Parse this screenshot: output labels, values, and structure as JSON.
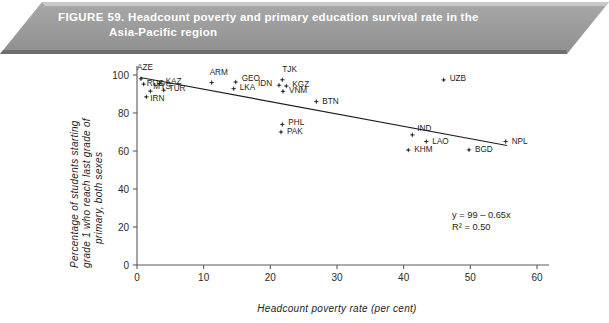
{
  "banner": {
    "figure_number": "FIGURE 59.",
    "title_line1": "Headcount poverty and primary education survival rate in the",
    "title_line2": "Asia-Pacific region",
    "bg_color": "#9d9d9d",
    "text_color": "#ffffff"
  },
  "chart_data": {
    "type": "scatter",
    "title": "Headcount poverty and primary education survival rate in the Asia-Pacific region",
    "xlabel": "Headcount poverty rate (per cent)",
    "ylabel": "Percentage of students starting grade 1 who reach last grade of primary, both sexes",
    "ylabel_line1": "Percentage of students starting",
    "ylabel_line2": "grade 1 who reach last grade of",
    "ylabel_line3": "primary, both sexes",
    "xlim": [
      0,
      60
    ],
    "ylim": [
      0,
      100
    ],
    "xticks": [
      0,
      10,
      20,
      30,
      40,
      50,
      60
    ],
    "yticks": [
      0,
      20,
      40,
      60,
      80,
      100
    ],
    "grid": false,
    "legend": "none",
    "marker": "plus-dot",
    "points": [
      {
        "label": "AZE",
        "x": 0.6,
        "y": 98.0,
        "lx": -4,
        "ly": -9
      },
      {
        "label": "RUS",
        "x": 1.0,
        "y": 95.2,
        "lx": 3,
        "ly": 2
      },
      {
        "label": "KAZ",
        "x": 3.4,
        "y": 95.6,
        "lx": 6,
        "ly": 1
      },
      {
        "label": "TUR",
        "x": 4.0,
        "y": 92.0,
        "lx": 5,
        "ly": 1
      },
      {
        "label": "MYS",
        "x": 2.0,
        "y": 91.5,
        "lx": 3,
        "ly": -2
      },
      {
        "label": "IRN",
        "x": 1.4,
        "y": 88.5,
        "lx": 4,
        "ly": 4
      },
      {
        "label": "ARM",
        "x": 11.2,
        "y": 96.0,
        "lx": -2,
        "ly": -8
      },
      {
        "label": "GEO",
        "x": 14.8,
        "y": 96.3,
        "lx": 6,
        "ly": -1
      },
      {
        "label": "LKA",
        "x": 14.5,
        "y": 92.8,
        "lx": 6,
        "ly": 1
      },
      {
        "label": "TJK",
        "x": 21.8,
        "y": 97.5,
        "lx": 0,
        "ly": -8
      },
      {
        "label": "IDN",
        "x": 21.3,
        "y": 94.6,
        "lx": -21,
        "ly": 1
      },
      {
        "label": "KGZ",
        "x": 22.4,
        "y": 94.2,
        "lx": 6,
        "ly": 1
      },
      {
        "label": "VNM",
        "x": 21.9,
        "y": 91.4,
        "lx": 6,
        "ly": 2
      },
      {
        "label": "BTN",
        "x": 26.9,
        "y": 86.0,
        "lx": 6,
        "ly": 2
      },
      {
        "label": "PHL",
        "x": 21.8,
        "y": 74.0,
        "lx": 6,
        "ly": 1
      },
      {
        "label": "PAK",
        "x": 21.6,
        "y": 70.0,
        "lx": 6,
        "ly": 2
      },
      {
        "label": "UZB",
        "x": 46.0,
        "y": 97.4,
        "lx": 6,
        "ly": 1
      },
      {
        "label": "IND",
        "x": 41.3,
        "y": 68.5,
        "lx": 5,
        "ly": -4
      },
      {
        "label": "LAO",
        "x": 43.4,
        "y": 65.0,
        "lx": 6,
        "ly": 2
      },
      {
        "label": "KHM",
        "x": 40.7,
        "y": 60.5,
        "lx": 6,
        "ly": 2
      },
      {
        "label": "BGD",
        "x": 49.8,
        "y": 60.6,
        "lx": 6,
        "ly": 2
      },
      {
        "label": "NPL",
        "x": 55.3,
        "y": 65.0,
        "lx": 6,
        "ly": 2
      }
    ],
    "fit_line": {
      "equation": "y = 99 – 0.65x",
      "r_squared": "R² = 0.50",
      "intercept": 99,
      "slope": -0.65,
      "x_start": 0.5,
      "x_end": 55.5
    }
  }
}
